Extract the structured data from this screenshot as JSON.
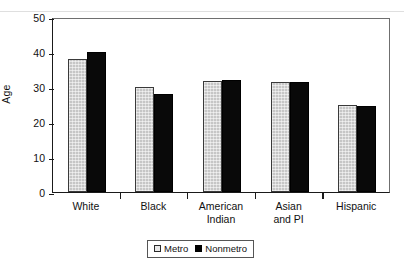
{
  "chart_data": {
    "type": "bar",
    "title": "",
    "subtitle": "",
    "xlabel": "",
    "ylabel": "Age",
    "ylim": [
      0,
      50
    ],
    "yticks": [
      0,
      10,
      20,
      30,
      40,
      50
    ],
    "ytick_labels": [
      "0",
      "10",
      "20",
      "30",
      "40",
      "50"
    ],
    "grid": false,
    "legend_position": "bottom-center",
    "categories": [
      "White",
      "Black",
      "American\nIndian",
      "Asian\nand PI",
      "Hispanic"
    ],
    "series": [
      {
        "name": "Metro",
        "color": "#c6c6c6",
        "values": [
          38.0,
          30.0,
          31.8,
          31.3,
          24.8
        ]
      },
      {
        "name": "Nonmetro",
        "color": "#000000",
        "values": [
          40.0,
          28.0,
          32.1,
          31.5,
          24.5
        ]
      }
    ]
  },
  "legend": {
    "items": [
      {
        "label": "Metro",
        "swatch": "metro-swatch-icon"
      },
      {
        "label": "Nonmetro",
        "swatch": "nonmetro-swatch-icon"
      }
    ]
  },
  "colors": {
    "metro_fill": "#c6c6c6",
    "nonmetro_fill": "#000000",
    "axis": "#1a1a1a",
    "frame": "#6f6f6f",
    "text": "#111111",
    "background": "#ffffff"
  }
}
